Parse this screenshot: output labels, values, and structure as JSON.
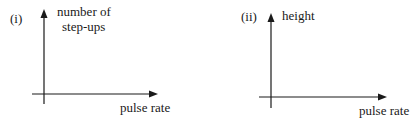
{
  "panels": [
    {
      "id": "i",
      "label": "(i)",
      "y_axis_label_line1": "number of",
      "y_axis_label_line2": "step-ups",
      "x_axis_label": "pulse rate"
    },
    {
      "id": "ii",
      "label": "(ii)",
      "y_axis_label_line1": "height",
      "x_axis_label": "pulse rate"
    }
  ],
  "colors": {
    "axis": "#1a1a1a",
    "text": "#1a1a1a",
    "background": "#ffffff"
  }
}
